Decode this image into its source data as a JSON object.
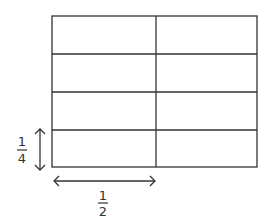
{
  "diagram": {
    "grid": {
      "columns": 2,
      "rows": 4
    },
    "line_color": "#333333",
    "vertical_dimension": {
      "numerator": "1",
      "denominator": "4"
    },
    "horizontal_dimension": {
      "numerator": "1",
      "denominator": "2"
    }
  }
}
